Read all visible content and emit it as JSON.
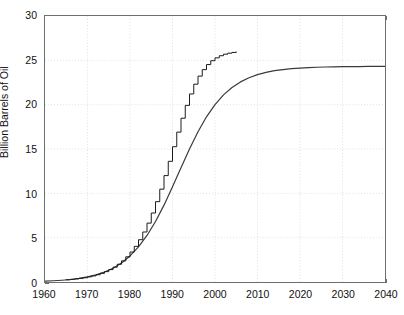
{
  "chart_data": {
    "type": "line",
    "title": "",
    "xlabel": "",
    "ylabel": "Billion Barrels of Oil",
    "xlim": [
      1960,
      2040
    ],
    "ylim": [
      0,
      30
    ],
    "xticks": [
      1960,
      1970,
      1980,
      1990,
      2000,
      2010,
      2020,
      2030,
      2040
    ],
    "yticks": [
      0,
      5,
      10,
      15,
      20,
      25,
      30
    ],
    "grid": true,
    "grid_style": "dotted",
    "legend": "none",
    "series": [
      {
        "name": "Logistic cumulative curve",
        "style": "smooth-line",
        "color": "#3a3a3a",
        "x": [
          1960,
          1962,
          1964,
          1966,
          1968,
          1970,
          1972,
          1974,
          1976,
          1978,
          1980,
          1982,
          1984,
          1986,
          1988,
          1990,
          1992,
          1994,
          1996,
          1998,
          2000,
          2002,
          2004,
          2006,
          2008,
          2010,
          2012,
          2014,
          2016,
          2018,
          2020,
          2022,
          2024,
          2026,
          2028,
          2030,
          2032,
          2034,
          2036,
          2038,
          2040
        ],
        "y": [
          0.1,
          0.14,
          0.2,
          0.28,
          0.4,
          0.57,
          0.8,
          1.12,
          1.56,
          2.15,
          2.94,
          3.96,
          5.25,
          6.82,
          8.67,
          10.73,
          12.89,
          15.01,
          16.95,
          18.63,
          20.01,
          21.1,
          21.94,
          22.57,
          23.04,
          23.39,
          23.64,
          23.83,
          23.96,
          24.06,
          24.13,
          24.18,
          24.22,
          24.25,
          24.27,
          24.28,
          24.29,
          24.3,
          24.31,
          24.31,
          24.32
        ]
      },
      {
        "name": "Annual cumulative production (stair-step)",
        "style": "step",
        "color": "#1a1a1a",
        "x": [
          1965,
          1966,
          1967,
          1968,
          1969,
          1970,
          1971,
          1972,
          1973,
          1974,
          1975,
          1976,
          1977,
          1978,
          1979,
          1980,
          1981,
          1982,
          1983,
          1984,
          1985,
          1986,
          1987,
          1988,
          1989,
          1990,
          1991,
          1992,
          1993,
          1994,
          1995,
          1996,
          1997,
          1998,
          1999,
          2000,
          2001,
          2002,
          2003,
          2004,
          2005
        ],
        "y": [
          0.25,
          0.3,
          0.35,
          0.41,
          0.48,
          0.58,
          0.69,
          0.82,
          0.98,
          1.17,
          1.4,
          1.67,
          2.0,
          2.38,
          2.84,
          3.38,
          4.02,
          4.77,
          5.64,
          6.64,
          7.78,
          9.06,
          10.47,
          12.0,
          13.61,
          15.26,
          16.9,
          18.47,
          19.92,
          21.21,
          22.31,
          23.22,
          23.95,
          24.52,
          24.96,
          25.28,
          25.52,
          25.69,
          25.81,
          25.89,
          25.95
        ]
      }
    ],
    "plateau_value": 25.5,
    "inflection_year": 1994
  },
  "axes": {
    "ylabel": "Billion Barrels of Oil",
    "ytick_labels": [
      "30",
      "25",
      "20",
      "15",
      "10",
      "5",
      "0"
    ],
    "xtick_labels": [
      "1960",
      "1970",
      "1980",
      "1990",
      "2000",
      "2010",
      "2020",
      "2030",
      "2040"
    ]
  }
}
